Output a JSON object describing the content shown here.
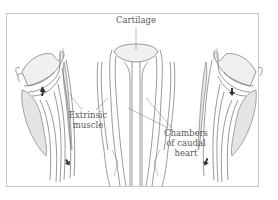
{
  "figure": {
    "labels": {
      "cartilage": "Cartilage",
      "extrinsic_muscle_line1": "Extrinsic",
      "extrinsic_muscle_line2": "muscle",
      "chambers_line1": "Chambers",
      "chambers_line2": "of caudal",
      "chambers_line3": "heart"
    },
    "panels": [
      "left-lateral-view",
      "center-frontal-view",
      "right-lateral-view"
    ]
  }
}
